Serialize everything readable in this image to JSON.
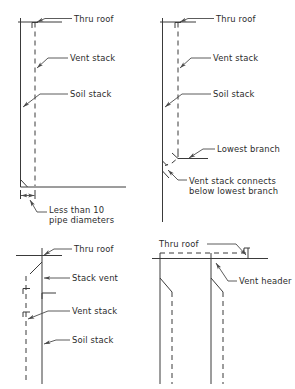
{
  "figure": {
    "background_color": "#ffffff",
    "line_color": "#3a3a3a",
    "leader_color": "#4a4a4a",
    "text_color": "#2b2b2b"
  },
  "panels": [
    {
      "id": "top-left",
      "name": "vent-stack-through-roof-with-offset",
      "labels": [
        {
          "key": "thru_roof",
          "text": "Thru roof"
        },
        {
          "key": "vent_stack",
          "text": "Vent stack"
        },
        {
          "key": "soil_stack",
          "text": "Soil stack"
        },
        {
          "key": "dimension_line1",
          "text": "Less than 10"
        },
        {
          "key": "dimension_line2",
          "text": "pipe diameters"
        }
      ]
    },
    {
      "id": "top-right",
      "name": "vent-stack-connects-below-lowest-branch",
      "labels": [
        {
          "key": "thru_roof",
          "text": "Thru roof"
        },
        {
          "key": "vent_stack",
          "text": "Vent stack"
        },
        {
          "key": "soil_stack",
          "text": "Soil stack"
        },
        {
          "key": "lowest_branch",
          "text": "Lowest branch"
        },
        {
          "key": "connects_line1",
          "text": "Vent stack connects"
        },
        {
          "key": "connects_line2",
          "text": "below lowest branch"
        }
      ]
    },
    {
      "id": "bottom-left",
      "name": "stack-vent-and-vent-stack",
      "labels": [
        {
          "key": "thru_roof",
          "text": "Thru roof"
        },
        {
          "key": "stack_vent",
          "text": "Stack vent"
        },
        {
          "key": "vent_stack",
          "text": "Vent stack"
        },
        {
          "key": "soil_stack",
          "text": "Soil stack"
        }
      ]
    },
    {
      "id": "bottom-right",
      "name": "vent-header-through-roof",
      "labels": [
        {
          "key": "thru_roof",
          "text": "Thru roof"
        },
        {
          "key": "vent_header",
          "text": "Vent header"
        }
      ]
    }
  ]
}
